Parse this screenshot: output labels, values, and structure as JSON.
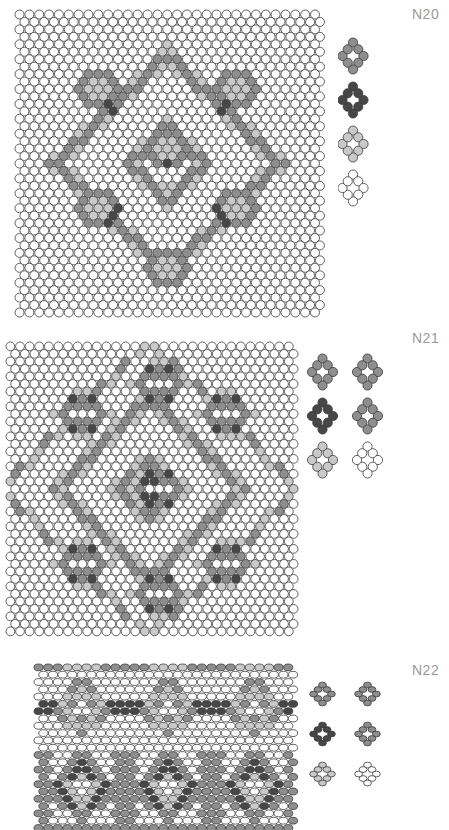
{
  "document": {
    "type": "beadwork-pattern-chart-sheet",
    "background_color": "#ffffff",
    "label_color": "#9a9a9a"
  },
  "palette": {
    "white": "#ffffff",
    "light_gray": "#c9c9c9",
    "medium_gray": "#8e8e8e",
    "dark_gray": "#474747",
    "outline": "#3a3a3a"
  },
  "panels": [
    {
      "id": "n20",
      "label": "N20",
      "label_x": 412,
      "label_y": 6,
      "chart_x": 14,
      "chart_y": 8,
      "cols": 31,
      "rows": 41,
      "pitch_x": 9.85,
      "pitch_y": 7.45,
      "bead_rx": 4.5,
      "bead_ry": 4.5,
      "legend_x": 338,
      "legend_y": 36,
      "legend_cols": 1,
      "legend_rows": 4,
      "legend_pitch_x": 42,
      "legend_pitch_y": 44,
      "legend_shades": [
        "medium_gray",
        "dark_gray",
        "light_gray",
        "white"
      ],
      "legend_scale": 1.0
    },
    {
      "id": "n21",
      "label": "N21",
      "label_x": 412,
      "label_y": 330,
      "chart_x": 5,
      "chart_y": 340,
      "cols": 30,
      "rows": 39,
      "pitch_x": 9.6,
      "pitch_y": 7.5,
      "bead_rx": 4.4,
      "bead_ry": 4.4,
      "legend_x": 306,
      "legend_y": 352,
      "legend_cols": 2,
      "legend_rows": 3,
      "legend_pitch_x": 45,
      "legend_pitch_y": 44,
      "legend_shades": [
        "medium_gray",
        "medium_gray",
        "dark_gray",
        "medium_gray",
        "light_gray",
        "white"
      ],
      "legend_scale": 1.0
    },
    {
      "id": "n22",
      "label": "N22",
      "label_x": 412,
      "label_y": 662,
      "chart_x": 33,
      "chart_y": 662,
      "cols": 27,
      "rows": 23,
      "pitch_x": 9.6,
      "pitch_y": 7.3,
      "bead_rx": 4.6,
      "bead_ry": 3.4,
      "legend_x": 306,
      "legend_y": 676,
      "legend_cols": 2,
      "legend_rows": 3,
      "legend_pitch_x": 45,
      "legend_pitch_y": 40,
      "legend_shades": [
        "medium_gray",
        "medium_gray",
        "dark_gray",
        "medium_gray",
        "light_gray",
        "white"
      ],
      "legend_scale": 0.85,
      "squashed": true
    }
  ],
  "motif": {
    "description": "eight-bead ring around an open center",
    "ring_offsets": [
      [
        0,
        -1
      ],
      [
        0.5,
        -0.5
      ],
      [
        1,
        0
      ],
      [
        0.5,
        0.5
      ],
      [
        0,
        1
      ],
      [
        -0.5,
        0.5
      ],
      [
        -1,
        0
      ],
      [
        -0.5,
        -0.5
      ]
    ]
  },
  "chart_data": {
    "type": "heatmap",
    "legend_position": "right",
    "shade_levels": [
      "white",
      "light_gray",
      "medium_gray",
      "dark_gray"
    ],
    "grids": {
      "n20": {
        "cols": 31,
        "rows": 41,
        "note": "Symmetric diamond lattice: nested rhombus outlines in medium gray with dark-gray accent beads at the lattice crossings and light-gray fills inside the small diamonds; plain white field at the borders.",
        "motif_centers": [
          [
            8,
            10
          ],
          [
            22,
            10
          ],
          [
            15,
            18
          ],
          [
            8,
            26
          ],
          [
            22,
            26
          ],
          [
            15,
            34
          ]
        ],
        "diamond_half_width": 7,
        "diamond_half_height": 9
      },
      "n21": {
        "cols": 30,
        "rows": 39,
        "note": "Same family as N20 but denser: concentric rhombus rings of medium gray with dark-gray corner beads and light-gray inner rings; six large diamond medallions around a central one.",
        "motif_centers": [
          [
            7,
            9
          ],
          [
            22,
            9
          ],
          [
            15,
            19
          ],
          [
            7,
            29
          ],
          [
            22,
            29
          ],
          [
            15,
            5
          ],
          [
            15,
            33
          ]
        ],
        "diamond_half_width": 7,
        "diamond_half_height": 9
      },
      "n22": {
        "cols": 27,
        "rows": 23,
        "note": "Horizontally banded repeat: three medallion columns; upper half is a vertically streaked lacy band, lower half shows three dark-ringed rosettes on a medium-gray ground. Beads are drawn vertically squashed.",
        "motif_centers": [
          [
            4,
            16
          ],
          [
            13,
            16
          ],
          [
            22,
            16
          ],
          [
            4,
            5
          ],
          [
            13,
            5
          ],
          [
            22,
            5
          ]
        ],
        "repeat_x": 9,
        "repeat_y": 11
      }
    }
  }
}
